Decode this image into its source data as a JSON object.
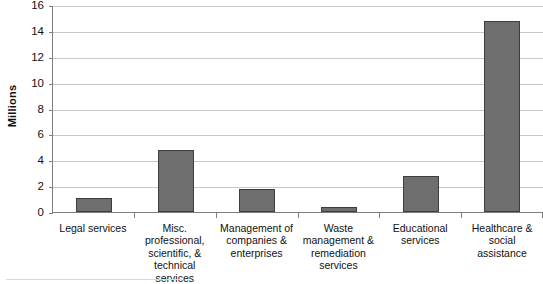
{
  "chart_data": {
    "type": "bar",
    "title": "",
    "xlabel": "",
    "ylabel": "Millions",
    "ylim": [
      0,
      16
    ],
    "ytick_step": 2,
    "yticks": [
      16,
      14,
      12,
      10,
      8,
      6,
      4,
      2,
      0
    ],
    "grid": true,
    "legend": "none",
    "bar_color": "#6e6e6e",
    "bar_border_color": "#3d3d3d",
    "gridline_color": "#c8c8c8",
    "axis_color": "#7d7d7d",
    "categories": [
      "Legal services",
      "Misc. professional, scientific, & technical services",
      "Management of companies & enterprises",
      "Waste management & remediation services",
      "Educational services",
      "Healthcare & social assistance"
    ],
    "values": [
      1.05,
      4.8,
      1.75,
      0.35,
      2.8,
      14.8
    ]
  },
  "axis": {
    "y_title": "Millions",
    "tick_labels": [
      "16",
      "14",
      "12",
      "10",
      "8",
      "6",
      "4",
      "2",
      "0"
    ]
  },
  "categories_display": [
    {
      "lines": [
        "Legal services"
      ]
    },
    {
      "lines": [
        "Misc.",
        "professional,",
        "scientific, &",
        "technical",
        "services"
      ]
    },
    {
      "lines": [
        "Management of",
        "companies &",
        "enterprises"
      ]
    },
    {
      "lines": [
        "Waste",
        "management &",
        "remediation",
        "services"
      ]
    },
    {
      "lines": [
        "Educational",
        "services"
      ]
    },
    {
      "lines": [
        "Healthcare &",
        "social",
        "assistance"
      ]
    }
  ]
}
